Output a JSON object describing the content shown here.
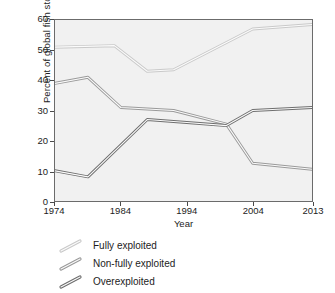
{
  "chart_data": {
    "type": "line",
    "title": "",
    "xlabel": "Year",
    "ylabel": "Percent of global fish stocks",
    "xlim": [
      1974,
      2013
    ],
    "ylim": [
      0,
      60
    ],
    "grid": false,
    "legend_position": "below-axes-left",
    "x_ticks": [
      1974,
      1984,
      1994,
      2004,
      2013
    ],
    "x_tick_labels": [
      "1974",
      "1984",
      "1994",
      "2004",
      "2013"
    ],
    "y_ticks": [
      0,
      10,
      20,
      30,
      40,
      50,
      60
    ],
    "y_tick_labels": [
      "0",
      "10",
      "20",
      "30",
      "40",
      "50",
      "60"
    ],
    "series": [
      {
        "name": "Fully exploited",
        "color": "#c9c9c9",
        "x": [
          1974,
          1983,
          1988,
          1992,
          2004,
          2013
        ],
        "values": [
          51,
          51.5,
          43,
          43.5,
          57,
          58.5
        ]
      },
      {
        "name": "Non-fully exploited",
        "color": "#9a9a9a",
        "x": [
          1974,
          1979,
          1984,
          1992,
          2000,
          2004,
          2013
        ],
        "values": [
          39,
          41,
          31,
          30,
          25.5,
          12.5,
          10.5
        ]
      },
      {
        "name": "Overexploited",
        "color": "#6e6e6e",
        "x": [
          1974,
          1979,
          1988,
          1994,
          2000,
          2004,
          2013
        ],
        "values": [
          10,
          8,
          27,
          26,
          25,
          30,
          31
        ]
      }
    ]
  },
  "axes": {
    "y_title": "Percent of global fish stocks",
    "x_title": "Year",
    "y_labels": [
      "60",
      "50",
      "40",
      "30",
      "20",
      "10",
      "0"
    ],
    "x_labels": [
      "1974",
      "1984",
      "1994",
      "2004",
      "2013"
    ]
  },
  "legend": {
    "items": [
      {
        "label": "Fully exploited",
        "color": "#c9c9c9"
      },
      {
        "label": "Non-fully exploited",
        "color": "#9a9a9a"
      },
      {
        "label": "Overexploited",
        "color": "#6e6e6e"
      }
    ]
  },
  "colors": {
    "plot_background": "#f1f1f1",
    "frame": "#6b6b6b",
    "text": "#1c1c1c"
  }
}
